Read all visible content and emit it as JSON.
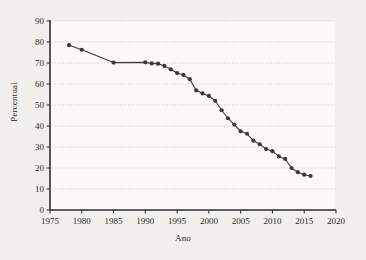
{
  "chart_data": {
    "type": "line",
    "title": "",
    "xlabel": "Ano",
    "ylabel": "Percentual",
    "xlim": [
      1975,
      2020
    ],
    "ylim": [
      0,
      90
    ],
    "xticks": [
      1975,
      1980,
      1985,
      1990,
      1995,
      2000,
      2005,
      2010,
      2015,
      2020
    ],
    "yticks": [
      0,
      10,
      20,
      30,
      40,
      50,
      60,
      70,
      80,
      90
    ],
    "grid": true,
    "legend": "none",
    "marker": "circle",
    "series": [
      {
        "name": "Percentual",
        "color": "#3a3a3a",
        "x": [
          1978,
          1980,
          1985,
          1990,
          1991,
          1992,
          1993,
          1994,
          1995,
          1996,
          1997,
          1998,
          1999,
          2000,
          2001,
          2002,
          2003,
          2004,
          2005,
          2006,
          2007,
          2008,
          2009,
          2010,
          2011,
          2012,
          2013,
          2014,
          2015,
          2016
        ],
        "values": [
          78.5,
          76.3,
          70.2,
          70.3,
          69.8,
          69.7,
          68.6,
          67.0,
          65.2,
          64.3,
          62.3,
          57.0,
          55.5,
          54.3,
          52.0,
          47.5,
          43.7,
          40.7,
          37.5,
          36.3,
          33.0,
          31.3,
          29.0,
          28.0,
          25.5,
          24.3,
          20.0,
          18.0,
          16.8,
          16.2
        ]
      }
    ]
  },
  "axis": {
    "ytick_labels": [
      "90",
      "80",
      "70",
      "60",
      "50",
      "40",
      "30",
      "20",
      "10",
      "0"
    ],
    "xtick_labels": [
      "1975",
      "1980",
      "1985",
      "1990",
      "1995",
      "2000",
      "2005",
      "2010",
      "2015",
      "2020"
    ]
  },
  "colors": {
    "background": "#f2f0ec",
    "plot_background": "#fbfaf8",
    "line": "#3a3a3a",
    "marker": "#3a3a3a",
    "axis": "#2b2b2b",
    "grid": "#c9c5bd"
  }
}
